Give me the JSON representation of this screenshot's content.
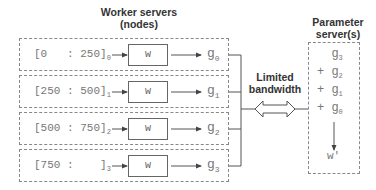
{
  "workers": {
    "title_line1": "Worker servers",
    "title_line2": "(nodes)",
    "rows": [
      {
        "range": "[0   : 250]",
        "index": "0",
        "weight": "w",
        "grad": "g",
        "grad_index": "0"
      },
      {
        "range": "[250 : 500]",
        "index": "1",
        "weight": "w",
        "grad": "g",
        "grad_index": "1"
      },
      {
        "range": "[500 : 750]",
        "index": "2",
        "weight": "w",
        "grad": "g",
        "grad_index": "2"
      },
      {
        "range": "[750 :    ]",
        "index": "3",
        "weight": "w",
        "grad": "g",
        "grad_index": "3"
      }
    ]
  },
  "link": {
    "label_line1": "Limited",
    "label_line2": "bandwidth"
  },
  "parameter_server": {
    "title_line1": "Parameter",
    "title_line2": "server(s)",
    "sum_terms": [
      {
        "prefix": "  ",
        "symbol": "g",
        "index": "3"
      },
      {
        "prefix": "+ ",
        "symbol": "g",
        "index": "2"
      },
      {
        "prefix": "+ ",
        "symbol": "g",
        "index": "1"
      },
      {
        "prefix": "+ ",
        "symbol": "g",
        "index": "0"
      }
    ],
    "result": "w'"
  },
  "colors": {
    "text": "#333333",
    "muted_text": "#777777",
    "lines": "#555555",
    "dashed_border": "#888888"
  }
}
